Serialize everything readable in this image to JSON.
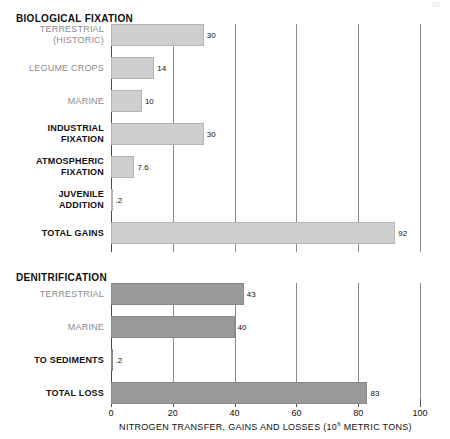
{
  "corner_note": "65",
  "chart_data": {
    "type": "bar",
    "orientation": "horizontal",
    "title": "",
    "xlabel": "NITROGEN TRANSFER, GAINS AND LOSSES (10^6 METRIC TONS)",
    "xlabel_prefix": "NITROGEN TRANSFER, GAINS AND LOSSES (10",
    "xlabel_exponent": "6",
    "xlabel_suffix": " METRIC TONS)",
    "ylabel": "",
    "xlim": [
      0,
      100
    ],
    "xticks": [
      0,
      20,
      40,
      60,
      80,
      100
    ],
    "xtick_labels": [
      "0",
      "20",
      "40",
      "60",
      "80",
      "100"
    ],
    "grid": true,
    "grid_axis": "x",
    "legend": "none",
    "colors": {
      "gains_bar": "#cfcfcf",
      "losses_bar": "#9a9a9a",
      "gridline": "#8a8a8a",
      "axis": "#4a4a4a",
      "label_gray": "#8c8c8c",
      "label_black": "#111111"
    },
    "sections": [
      {
        "id": "biological-fixation",
        "header": "BIOLOGICAL FIXATION",
        "bar_style": "light",
        "categories": [
          "TERRESTRIAL (HISTORIC)",
          "LEGUME CROPS",
          "MARINE",
          "INDUSTRIAL FIXATION",
          "ATMOSPHERIC FIXATION",
          "JUVENILE ADDITION",
          "TOTAL GAINS"
        ],
        "values": [
          30,
          14,
          10,
          30,
          7.6,
          0.2,
          92
        ],
        "rows": [
          {
            "label_lines": [
              "TERRESTRIAL",
              "(HISTORIC)"
            ],
            "label_weight": "gray",
            "value": 30,
            "value_label": "30"
          },
          {
            "label_lines": [
              "LEGUME CROPS"
            ],
            "label_weight": "gray",
            "value": 14,
            "value_label": "14"
          },
          {
            "label_lines": [
              "MARINE"
            ],
            "label_weight": "gray",
            "value": 10,
            "value_label": "10"
          },
          {
            "label_lines": [
              "INDUSTRIAL",
              "FIXATION"
            ],
            "label_weight": "black",
            "value": 30,
            "value_label": "30"
          },
          {
            "label_lines": [
              "ATMOSPHERIC",
              "FIXATION"
            ],
            "label_weight": "black",
            "value": 7.6,
            "value_label": "7.6"
          },
          {
            "label_lines": [
              "JUVENILE",
              "ADDITION"
            ],
            "label_weight": "black",
            "value": 0.2,
            "value_label": ".2"
          },
          {
            "label_lines": [
              "TOTAL GAINS"
            ],
            "label_weight": "black",
            "value": 92,
            "value_label": "92"
          }
        ]
      },
      {
        "id": "denitrification",
        "header": "DENITRIFICATION",
        "bar_style": "dark",
        "categories": [
          "TERRESTRIAL",
          "MARINE",
          "TO SEDIMENTS",
          "TOTAL LOSS"
        ],
        "values": [
          43,
          40,
          0.2,
          83
        ],
        "rows": [
          {
            "label_lines": [
              "TERRESTRIAL"
            ],
            "label_weight": "gray",
            "value": 43,
            "value_label": "43"
          },
          {
            "label_lines": [
              "MARINE"
            ],
            "label_weight": "gray",
            "value": 40,
            "value_label": "40"
          },
          {
            "label_lines": [
              "TO SEDIMENTS"
            ],
            "label_weight": "black",
            "value": 0.2,
            "value_label": ".2"
          },
          {
            "label_lines": [
              "TOTAL LOSS"
            ],
            "label_weight": "black",
            "value": 83,
            "value_label": "83"
          }
        ]
      }
    ]
  }
}
